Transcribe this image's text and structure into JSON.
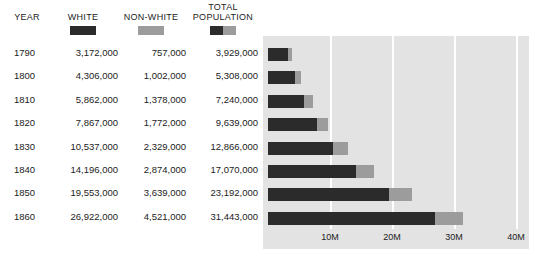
{
  "header": {
    "year": "YEAR",
    "white": "WHITE",
    "non_white": "NON-WHITE",
    "total_population": "TOTAL\nPOPULATION"
  },
  "legend": {
    "white_color": "#2b2b2b",
    "non_white_color": "#9c9c9c"
  },
  "rows": [
    {
      "year": "1790",
      "white": "3,172,000",
      "non_white": "757,000",
      "total": "3,929,000"
    },
    {
      "year": "1800",
      "white": "4,306,000",
      "non_white": "1,002,000",
      "total": "5,308,000"
    },
    {
      "year": "1810",
      "white": "5,862,000",
      "non_white": "1,378,000",
      "total": "7,240,000"
    },
    {
      "year": "1820",
      "white": "7,867,000",
      "non_white": "1,772,000",
      "total": "9,639,000"
    },
    {
      "year": "1830",
      "white": "10,537,000",
      "non_white": "2,329,000",
      "total": "12,866,000"
    },
    {
      "year": "1840",
      "white": "14,196,000",
      "non_white": "2,874,000",
      "total": "17,070,000"
    },
    {
      "year": "1850",
      "white": "19,553,000",
      "non_white": "3,639,000",
      "total": "23,192,000"
    },
    {
      "year": "1860",
      "white": "26,922,000",
      "non_white": "4,521,000",
      "total": "31,443,000"
    }
  ],
  "axis": {
    "ticks": [
      "10M",
      "20M",
      "30M",
      "40M"
    ],
    "tick_values": [
      10000000,
      20000000,
      30000000,
      40000000
    ]
  },
  "chart_data": {
    "type": "bar",
    "title": "",
    "subtitle": "",
    "orientation": "horizontal",
    "stacked": true,
    "categories": [
      "1790",
      "1800",
      "1810",
      "1820",
      "1830",
      "1840",
      "1850",
      "1860"
    ],
    "series": [
      {
        "name": "WHITE",
        "color": "#2b2b2b",
        "values": [
          3172000,
          4306000,
          5862000,
          7867000,
          10537000,
          14196000,
          19553000,
          26922000
        ]
      },
      {
        "name": "NON-WHITE",
        "color": "#9c9c9c",
        "values": [
          757000,
          1002000,
          1378000,
          1772000,
          2329000,
          2874000,
          3639000,
          4521000
        ]
      }
    ],
    "totals": [
      3929000,
      5308000,
      7240000,
      9639000,
      12866000,
      17070000,
      23192000,
      31443000
    ],
    "xlabel": "",
    "ylabel": "",
    "xlim": [
      0,
      40000000
    ],
    "xticks": [
      10000000,
      20000000,
      30000000,
      40000000
    ],
    "xticklabels": [
      "10M",
      "20M",
      "30M",
      "40M"
    ],
    "grid": "vertical-white-on-gray",
    "legend_position": "top-table-header",
    "plot_background": "#e3e3e3"
  }
}
